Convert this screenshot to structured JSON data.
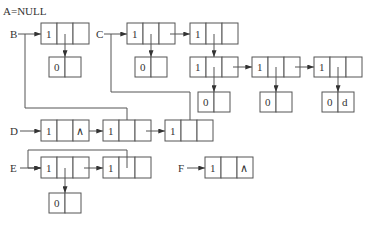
{
  "diagram": {
    "title": "A=NULL",
    "labels": {
      "B": "B",
      "C": "C",
      "D": "D",
      "E": "E",
      "F": "F"
    },
    "colors": {
      "stroke": "#555555",
      "text": "#333333",
      "background": "#ffffff"
    },
    "nodes": {
      "b1": {
        "tag": "1",
        "mid": "",
        "last": ""
      },
      "b1_sub": {
        "tag": "0",
        "val": ""
      },
      "c1": {
        "tag": "1",
        "mid": "",
        "last": ""
      },
      "c1_sub": {
        "tag": "0",
        "val": ""
      },
      "c2": {
        "tag": "1",
        "mid": "",
        "last": ""
      },
      "c2_r1": {
        "tag": "1",
        "mid": "",
        "last": ""
      },
      "c2_r2": {
        "tag": "1",
        "mid": "",
        "last": ""
      },
      "c2_r3": {
        "tag": "1",
        "mid": "",
        "last": ""
      },
      "c2_r1_sub": {
        "tag": "0",
        "val": ""
      },
      "c2_r2_sub": {
        "tag": "0",
        "val": ""
      },
      "c2_r3_sub": {
        "tag": "0",
        "val": "d"
      },
      "d1": {
        "tag": "1",
        "mid": "",
        "last": "∧"
      },
      "d2": {
        "tag": "1",
        "mid": "",
        "last": ""
      },
      "d3": {
        "tag": "1",
        "mid": "",
        "last": ""
      },
      "e1": {
        "tag": "1",
        "mid": "",
        "last": ""
      },
      "e1_sub": {
        "tag": "0",
        "val": ""
      },
      "e2": {
        "tag": "1",
        "mid": "",
        "last": ""
      },
      "f1": {
        "tag": "1",
        "mid": "",
        "last": "∧"
      }
    }
  }
}
